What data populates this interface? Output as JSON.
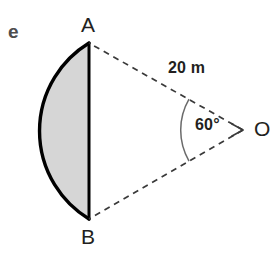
{
  "figure": {
    "item_letter": "e",
    "background_color": "#ffffff",
    "stroke_color": "#000000",
    "fill_color": "#d6d6d6",
    "dash_color": "#3a3a3a",
    "arc_color": "#6b6b6b",
    "text_color": "#231f20",
    "item_letter_color": "#4d4d4d"
  },
  "points": {
    "a": {
      "label": "A",
      "x": 89,
      "y": 43
    },
    "b": {
      "label": "B",
      "x": 89,
      "y": 219
    },
    "o": {
      "label": "O",
      "x": 243,
      "y": 130
    }
  },
  "measurements": {
    "radius_label": "20 m",
    "radius_value": 20,
    "radius_unit": "m",
    "angle_label": "60°",
    "angle_value": 60,
    "angle_unit": "degrees"
  },
  "elements": {
    "shaded_region": "circular-segment-AB",
    "chord": "AB",
    "dashed_radius_top": "OA",
    "dashed_radius_bottom": "OB",
    "angle_arc": "AOB"
  },
  "geometry": {
    "arc_leftmost_x": 33,
    "chord_x": 89,
    "arc_sweep_flag": 0,
    "segment_note": "Circular segment cut off by chord AB; arc bulges left away from centre O."
  }
}
